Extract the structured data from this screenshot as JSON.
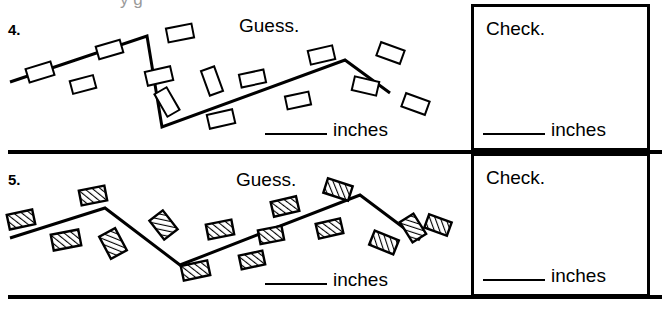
{
  "page": {
    "width": 662,
    "height": 311,
    "background": "#ffffff",
    "ink": "#000000",
    "clipped_top_text": "y  g"
  },
  "rows": [
    {
      "number": "4.",
      "guess_label": "Guess.",
      "check_label": "Check.",
      "guess_unit": "inches",
      "check_unit": "inches",
      "guess_value": "",
      "check_value": "",
      "path_style": "outline",
      "marker_style": "plain",
      "path_points": "10,82 147,36 162,127 345,60 390,93",
      "markers": [
        {
          "x": 27,
          "y": 65,
          "w": 26,
          "h": 14,
          "rot": -17
        },
        {
          "x": 71,
          "y": 78,
          "w": 24,
          "h": 13,
          "rot": -15
        },
        {
          "x": 97,
          "y": 43,
          "w": 25,
          "h": 13,
          "rot": -16
        },
        {
          "x": 167,
          "y": 26,
          "w": 26,
          "h": 14,
          "rot": -11
        },
        {
          "x": 146,
          "y": 69,
          "w": 26,
          "h": 14,
          "rot": -13
        },
        {
          "x": 160,
          "y": 89,
          "w": 14,
          "h": 26,
          "rot": -30
        },
        {
          "x": 205,
          "y": 68,
          "w": 14,
          "h": 26,
          "rot": -20
        },
        {
          "x": 208,
          "y": 112,
          "w": 26,
          "h": 14,
          "rot": -13
        },
        {
          "x": 240,
          "y": 72,
          "w": 25,
          "h": 13,
          "rot": -12
        },
        {
          "x": 286,
          "y": 94,
          "w": 24,
          "h": 13,
          "rot": -12
        },
        {
          "x": 309,
          "y": 48,
          "w": 25,
          "h": 14,
          "rot": -13
        },
        {
          "x": 378,
          "y": 46,
          "w": 25,
          "h": 14,
          "rot": 20
        },
        {
          "x": 353,
          "y": 79,
          "w": 25,
          "h": 14,
          "rot": 13
        },
        {
          "x": 403,
          "y": 97,
          "w": 25,
          "h": 14,
          "rot": 20
        }
      ]
    },
    {
      "number": "5.",
      "guess_label": "Guess.",
      "check_label": "Check.",
      "guess_unit": "inches",
      "check_unit": "inches",
      "guess_value": "",
      "check_value": "",
      "path_style": "outline",
      "marker_style": "hatched",
      "path_points": "10,238 105,208 180,265 360,195 420,240",
      "markers": [
        {
          "x": 8,
          "y": 212,
          "w": 26,
          "h": 15,
          "rot": -12
        },
        {
          "x": 52,
          "y": 232,
          "w": 28,
          "h": 16,
          "rot": -11
        },
        {
          "x": 80,
          "y": 188,
          "w": 26,
          "h": 15,
          "rot": -11
        },
        {
          "x": 104,
          "y": 231,
          "w": 18,
          "h": 25,
          "rot": -28
        },
        {
          "x": 155,
          "y": 213,
          "w": 17,
          "h": 24,
          "rot": -38
        },
        {
          "x": 182,
          "y": 263,
          "w": 27,
          "h": 15,
          "rot": -12
        },
        {
          "x": 207,
          "y": 222,
          "w": 26,
          "h": 15,
          "rot": -11
        },
        {
          "x": 240,
          "y": 253,
          "w": 24,
          "h": 14,
          "rot": -12
        },
        {
          "x": 272,
          "y": 199,
          "w": 26,
          "h": 15,
          "rot": -13
        },
        {
          "x": 259,
          "y": 228,
          "w": 24,
          "h": 14,
          "rot": -11
        },
        {
          "x": 317,
          "y": 221,
          "w": 25,
          "h": 15,
          "rot": -13
        },
        {
          "x": 325,
          "y": 182,
          "w": 26,
          "h": 15,
          "rot": 18
        },
        {
          "x": 371,
          "y": 235,
          "w": 26,
          "h": 15,
          "rot": 22
        },
        {
          "x": 405,
          "y": 216,
          "w": 16,
          "h": 24,
          "rot": -32
        },
        {
          "x": 426,
          "y": 218,
          "w": 24,
          "h": 14,
          "rot": 20
        }
      ]
    }
  ]
}
